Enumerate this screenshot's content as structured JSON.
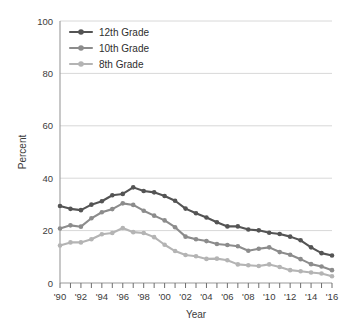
{
  "chart_data": {
    "type": "line",
    "title": "",
    "xlabel": "Year",
    "ylabel": "Percent",
    "ylim": [
      0,
      100
    ],
    "yticks": [
      0,
      20,
      40,
      60,
      80,
      100
    ],
    "ytick_labels": [
      "0",
      "20",
      "40",
      "60",
      "80",
      "100"
    ],
    "xlim": [
      1990,
      2016
    ],
    "x": [
      1990,
      1991,
      1992,
      1993,
      1994,
      1995,
      1996,
      1997,
      1998,
      1999,
      2000,
      2001,
      2002,
      2003,
      2004,
      2005,
      2006,
      2007,
      2008,
      2009,
      2010,
      2011,
      2012,
      2013,
      2014,
      2015,
      2016
    ],
    "xtick_labels": [
      "'90",
      "'92",
      "'94",
      "'96",
      "'98",
      "'00",
      "'02",
      "'04",
      "'06",
      "'08",
      "'10",
      "'12",
      "'14",
      "'16"
    ],
    "xtick_values": [
      1990,
      1992,
      1994,
      1996,
      1998,
      2000,
      2002,
      2004,
      2006,
      2008,
      2010,
      2012,
      2014,
      2016
    ],
    "grid": true,
    "grid_axis": "y",
    "legend_position": "top-left",
    "series": [
      {
        "name": "12th Grade",
        "color": "#545454",
        "values": [
          29.4,
          28.3,
          27.8,
          29.9,
          31.2,
          33.5,
          34.0,
          36.5,
          35.1,
          34.6,
          33.2,
          31.4,
          28.4,
          26.6,
          25.0,
          23.2,
          21.6,
          21.6,
          20.4,
          20.1,
          19.2,
          18.7,
          17.7,
          16.3,
          13.6,
          11.4,
          10.5
        ]
      },
      {
        "name": "10th Grade",
        "color": "#8c8c8c",
        "values": [
          20.8,
          22.0,
          21.5,
          24.7,
          27.0,
          28.2,
          30.4,
          29.8,
          27.6,
          25.7,
          23.9,
          21.3,
          17.7,
          16.7,
          16.0,
          14.9,
          14.5,
          14.0,
          12.3,
          13.1,
          13.6,
          11.8,
          10.8,
          9.1,
          7.2,
          6.3,
          4.9
        ]
      },
      {
        "name": "8th Grade",
        "color": "#b4b4b4",
        "values": [
          14.3,
          15.5,
          15.5,
          16.7,
          18.6,
          19.1,
          21.0,
          19.4,
          19.1,
          17.5,
          14.6,
          12.2,
          10.7,
          10.2,
          9.2,
          9.3,
          8.7,
          7.1,
          6.8,
          6.5,
          7.1,
          6.1,
          4.9,
          4.5,
          4.0,
          3.6,
          2.6
        ]
      }
    ]
  },
  "legend": {
    "entries": [
      {
        "label": "12th Grade"
      },
      {
        "label": "10th Grade"
      },
      {
        "label": "8th Grade"
      }
    ]
  },
  "axes": {
    "y_title": "Percent",
    "x_title": "Year"
  }
}
